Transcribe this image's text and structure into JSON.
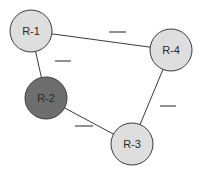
{
  "diagram": {
    "type": "network-graph",
    "nodes": [
      {
        "id": "R-1",
        "label": "R-1",
        "cx": 31,
        "cy": 31,
        "r": 21,
        "fill": "#dedede",
        "highlighted": false
      },
      {
        "id": "R-4",
        "label": "R-4",
        "cx": 171,
        "cy": 50,
        "r": 21,
        "fill": "#dedede",
        "highlighted": false
      },
      {
        "id": "R-2",
        "label": "R-2",
        "cx": 46,
        "cy": 98,
        "r": 21,
        "fill": "#6e6e6e",
        "highlighted": true
      },
      {
        "id": "R-3",
        "label": "R-3",
        "cx": 132,
        "cy": 144,
        "r": 21,
        "fill": "#dedede",
        "highlighted": false
      }
    ],
    "edges": [
      {
        "from": "R-1",
        "to": "R-4",
        "weight_label": "",
        "blank": {
          "x1": 109,
          "y1": 32,
          "x2": 126,
          "y2": 32
        }
      },
      {
        "from": "R-1",
        "to": "R-2",
        "weight_label": "",
        "blank": {
          "x1": 55,
          "y1": 61,
          "x2": 71,
          "y2": 61
        }
      },
      {
        "from": "R-4",
        "to": "R-3",
        "weight_label": "",
        "blank": {
          "x1": 160,
          "y1": 106,
          "x2": 176,
          "y2": 106
        }
      },
      {
        "from": "R-2",
        "to": "R-3",
        "weight_label": "",
        "blank": {
          "x1": 75,
          "y1": 126,
          "x2": 93,
          "y2": 126
        }
      }
    ]
  }
}
